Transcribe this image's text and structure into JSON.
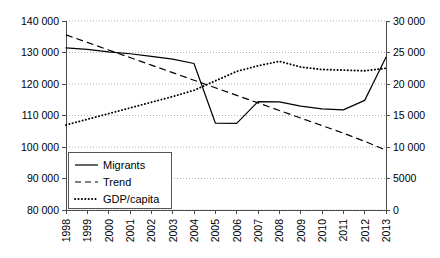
{
  "chart_data": {
    "type": "line",
    "title": "",
    "xlabel": "",
    "ylabel": "",
    "grid": true,
    "legend_position": "bottom-left",
    "categories": [
      "1998",
      "1999",
      "2000",
      "2001",
      "2002",
      "2003",
      "2004",
      "2005",
      "2006",
      "2007",
      "2008",
      "2009",
      "2010",
      "2011",
      "2012",
      "2013"
    ],
    "axes": {
      "left": {
        "label": "",
        "ylim": [
          80000,
          140000
        ],
        "ticks": [
          80000,
          90000,
          100000,
          110000,
          120000,
          130000,
          140000
        ],
        "tick_labels": [
          "80 000",
          "90 000",
          "100 000",
          "110 000",
          "120 000",
          "130 000",
          "140 000"
        ]
      },
      "right": {
        "label": "",
        "ylim": [
          0,
          30000
        ],
        "ticks": [
          0,
          5000,
          10000,
          15000,
          20000,
          25000,
          30000
        ],
        "tick_labels": [
          "0",
          "5000",
          "10 000",
          "15 000",
          "20 000",
          "25 000",
          "30 000"
        ]
      }
    },
    "series": [
      {
        "name": "Migrants",
        "axis": "left",
        "style": "solid",
        "values": [
          131500,
          131000,
          130200,
          129600,
          128800,
          127900,
          126500,
          107600,
          107500,
          114400,
          114300,
          113000,
          112100,
          111800,
          114800,
          128500
        ]
      },
      {
        "name": "Trend",
        "axis": "left",
        "style": "dashed",
        "values": [
          135600,
          133200,
          130800,
          128400,
          126000,
          123600,
          121200,
          118800,
          116400,
          114000,
          111600,
          109200,
          106800,
          104400,
          101800,
          99000
        ]
      },
      {
        "name": "GDP/capita",
        "axis": "right",
        "style": "dotted",
        "values": [
          13500,
          14400,
          15300,
          16200,
          17100,
          18000,
          19000,
          20500,
          22000,
          22900,
          23600,
          22700,
          22300,
          22200,
          22100,
          22500
        ]
      }
    ]
  },
  "legend": {
    "items": [
      {
        "label": "Migrants",
        "style": "solid"
      },
      {
        "label": "Trend",
        "style": "dashed"
      },
      {
        "label": "GDP/capita",
        "style": "dotted"
      }
    ]
  }
}
